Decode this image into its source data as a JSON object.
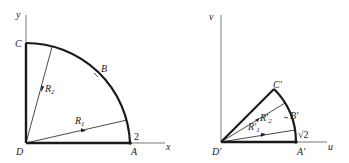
{
  "left_diagram": {
    "axes": {
      "x_label": "x",
      "y_label": "y"
    },
    "points": {
      "C": "C",
      "B": "B",
      "D": "D",
      "A": "A"
    },
    "radius_label": "2",
    "rays": {
      "R1": {
        "base": "R",
        "sub": "1"
      },
      "R2": {
        "base": "R",
        "sub": "2"
      }
    }
  },
  "right_diagram": {
    "axes": {
      "u_label": "u",
      "v_label": "v"
    },
    "points": {
      "C": "C′",
      "B": "B′",
      "D": "D′",
      "A": "A′"
    },
    "radius_label": "√2",
    "rays": {
      "R1": {
        "base": "R′",
        "sub": "1"
      },
      "R2": {
        "base": "R′",
        "sub": "2"
      }
    }
  },
  "colors": {
    "stroke": "#1a1a1a",
    "axis": "#555555",
    "background": "#ffffff"
  }
}
